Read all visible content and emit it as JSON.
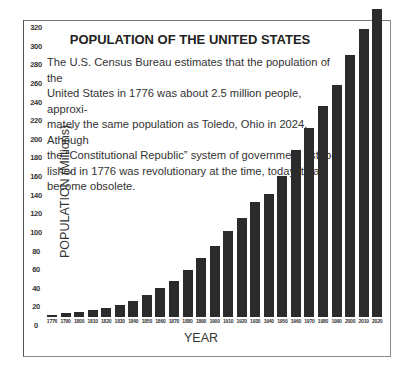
{
  "chart": {
    "title": "POPULATION OF THE UNITED STATES",
    "description_lines": [
      "The U.S. Census Bureau estimates that the population of the",
      "United States in 1776 was about 2.5 million people, approxi-",
      "mately the same population as Toledo, Ohio in 2024. Athough",
      "the “Constitutional Republic” system of government estab-",
      "lished in 1776 was revolutionary at the time, today it has",
      "become obsolete."
    ],
    "ylabel": "POPULATION (Millions)",
    "xlabel": "YEAR",
    "bar_color": "#2b2b2b"
  },
  "chart_data": {
    "type": "bar",
    "title": "POPULATION OF THE UNITED STATES",
    "xlabel": "YEAR",
    "ylabel": "POPULATION (Millions)",
    "ylim": [
      0,
      320
    ],
    "yticks": [
      0,
      20,
      40,
      60,
      80,
      100,
      120,
      140,
      160,
      180,
      200,
      220,
      240,
      260,
      280,
      300,
      320
    ],
    "grid": false,
    "legend": null,
    "categories": [
      "1776",
      "1790",
      "1800",
      "1810",
      "1820",
      "1830",
      "1840",
      "1850",
      "1860",
      "1870",
      "1880",
      "1890",
      "1900",
      "1910",
      "1920",
      "1930",
      "1940",
      "1950",
      "1960",
      "1970",
      "1980",
      "1990",
      "2000",
      "2010",
      "2020"
    ],
    "values": [
      2.5,
      3.9,
      5.3,
      7.2,
      9.6,
      12.9,
      17.1,
      23.2,
      31.4,
      38.6,
      50.2,
      62.9,
      76.2,
      92.2,
      106,
      123,
      132,
      151,
      179,
      203,
      227,
      249,
      281,
      309,
      331
    ],
    "annotations": [
      "The U.S. Census Bureau estimates that the population of the United States in 1776 was about 2.5 million people, approximately the same population as Toledo, Ohio in 2024. Athough the “Constitutional Republic” system of government established in 1776 was revolutionary at the time, today it has become obsolete."
    ]
  }
}
